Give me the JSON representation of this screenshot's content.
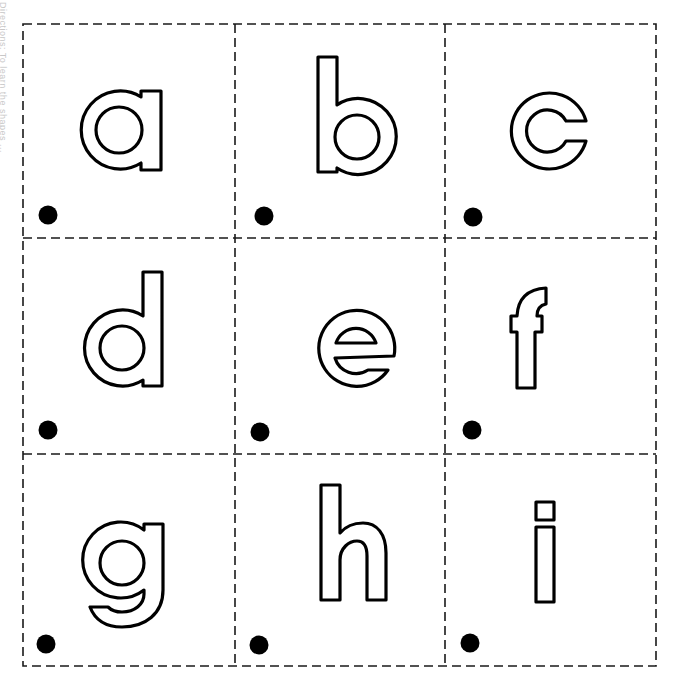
{
  "worksheet": {
    "side_instruction": "Directions: To learn the shapes ...",
    "grid": {
      "columns": 3,
      "rows": 3,
      "border_style": "dashed",
      "border_color": "#1a1a1a"
    },
    "cards": [
      {
        "letter": "a",
        "row": 0,
        "col": 0,
        "has_dot": true
      },
      {
        "letter": "b",
        "row": 0,
        "col": 1,
        "has_dot": true
      },
      {
        "letter": "c",
        "row": 0,
        "col": 2,
        "has_dot": true
      },
      {
        "letter": "d",
        "row": 1,
        "col": 0,
        "has_dot": true
      },
      {
        "letter": "e",
        "row": 1,
        "col": 1,
        "has_dot": true
      },
      {
        "letter": "f",
        "row": 1,
        "col": 2,
        "has_dot": true
      },
      {
        "letter": "g",
        "row": 2,
        "col": 0,
        "has_dot": true
      },
      {
        "letter": "h",
        "row": 2,
        "col": 1,
        "has_dot": true
      },
      {
        "letter": "i",
        "row": 2,
        "col": 2,
        "has_dot": true
      }
    ],
    "letter_style": {
      "stroke": "#000000",
      "fill": "#ffffff"
    },
    "dot_color": "#000000"
  }
}
